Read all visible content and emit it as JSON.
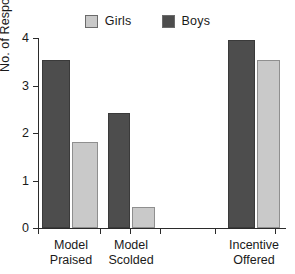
{
  "chart_data": {
    "type": "bar",
    "title": "",
    "subtitle": "",
    "xlabel": "",
    "ylabel": "No. of Responses",
    "ylim": [
      0,
      4
    ],
    "yticks": [
      0,
      1,
      2,
      3,
      4
    ],
    "ytick_labels": [
      "0",
      "1",
      "2",
      "3",
      "4"
    ],
    "grid": false,
    "legend_position": "top-center",
    "categories": [
      "Model Praised",
      "Model Scolded",
      "Incentive Offered"
    ],
    "category_lines": [
      [
        "Model",
        "Praised"
      ],
      [
        "Model",
        "Scolded"
      ],
      [
        "Incentive",
        "Offered"
      ]
    ],
    "series": [
      {
        "name": "Boys",
        "color": "#4d4d4d",
        "values": [
          3.53,
          2.42,
          3.95
        ]
      },
      {
        "name": "Girls",
        "color": "#c9c9c9",
        "values": [
          1.82,
          0.45,
          3.53
        ]
      }
    ],
    "series_draw_order": [
      "Boys",
      "Girls"
    ],
    "legend": [
      {
        "label": "Girls",
        "color": "#c9c9c9"
      },
      {
        "label": "Boys",
        "color": "#4d4d4d"
      }
    ],
    "annotations": []
  },
  "axis": {
    "y_title": "No. of Responses",
    "y_tick_labels": [
      "4",
      "3",
      "2",
      "1",
      "0"
    ]
  },
  "colors": {
    "boys": "#4d4d4d",
    "girls": "#c9c9c9",
    "axis": "#2b2b2b",
    "background": "#ffffff"
  }
}
